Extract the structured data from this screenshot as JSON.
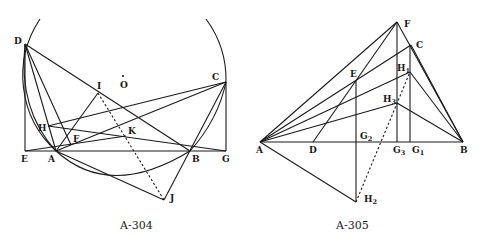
{
  "figures": [
    {
      "caption": "A-304",
      "points": {
        "D": "D",
        "O": "O",
        "I": "I",
        "C": "C",
        "H": "H",
        "F": "F",
        "K": "K",
        "E": "E",
        "A": "A",
        "B": "B",
        "G": "G",
        "J": "J"
      }
    },
    {
      "caption": "A-305",
      "points": {
        "F": "F",
        "C": "C",
        "H1": "H",
        "H1_sub": "1",
        "E": "E",
        "H3": "H",
        "H3_sub": "3",
        "A": "A",
        "D": "D",
        "G2": "G",
        "G2_sub": "2",
        "G3": "G",
        "G3_sub": "3",
        "G1": "G",
        "G1_sub": "1",
        "B": "B",
        "H2": "H",
        "H2_sub": "2"
      }
    }
  ]
}
